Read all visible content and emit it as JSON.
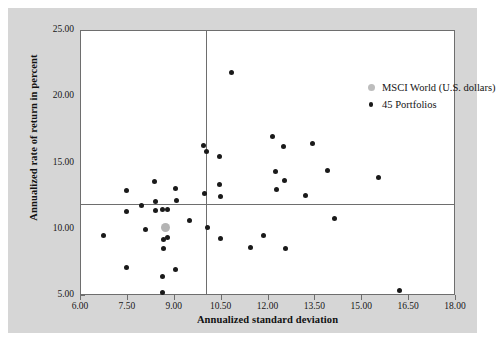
{
  "chart_data": {
    "type": "scatter",
    "title": "",
    "xlabel": "Annualized standard deviation",
    "ylabel": "Annualized rate of return in percent",
    "xlim": [
      6.0,
      18.0
    ],
    "ylim": [
      5.0,
      25.0
    ],
    "xticks": [
      "6.00",
      "7.50",
      "9.00",
      "10.50",
      "12.00",
      "13.50",
      "15.00",
      "16.50",
      "18.00"
    ],
    "yticks": [
      "5.00",
      "10.00",
      "15.00",
      "20.00",
      "25.00"
    ],
    "grid": false,
    "legend_position": "top-right",
    "reference_lines": {
      "vertical_x": 10.0,
      "horizontal_y": 11.95
    },
    "series": [
      {
        "name": "MSCI World (U.S. dollars)",
        "marker": "large-gray-circle",
        "color": "#b4b4b4",
        "points": [
          {
            "x": 8.7,
            "y": 10.2
          }
        ]
      },
      {
        "name": "45 Portfolios",
        "marker": "small-black-circle",
        "color": "#1a1a1a",
        "points": [
          {
            "x": 6.72,
            "y": 9.58
          },
          {
            "x": 7.44,
            "y": 13.0
          },
          {
            "x": 7.46,
            "y": 11.38
          },
          {
            "x": 7.44,
            "y": 7.13
          },
          {
            "x": 7.93,
            "y": 11.82
          },
          {
            "x": 8.06,
            "y": 10.05
          },
          {
            "x": 8.36,
            "y": 13.62
          },
          {
            "x": 8.38,
            "y": 12.15
          },
          {
            "x": 8.39,
            "y": 11.48
          },
          {
            "x": 8.61,
            "y": 11.52
          },
          {
            "x": 8.64,
            "y": 9.28
          },
          {
            "x": 8.63,
            "y": 8.58
          },
          {
            "x": 8.62,
            "y": 6.44
          },
          {
            "x": 8.6,
            "y": 5.25
          },
          {
            "x": 8.78,
            "y": 11.52
          },
          {
            "x": 8.78,
            "y": 9.38
          },
          {
            "x": 9.02,
            "y": 13.12
          },
          {
            "x": 9.04,
            "y": 12.22
          },
          {
            "x": 9.03,
            "y": 7.02
          },
          {
            "x": 9.47,
            "y": 10.68
          },
          {
            "x": 9.92,
            "y": 16.38
          },
          {
            "x": 9.95,
            "y": 12.7
          },
          {
            "x": 10.02,
            "y": 15.9
          },
          {
            "x": 10.04,
            "y": 10.15
          },
          {
            "x": 10.44,
            "y": 15.55
          },
          {
            "x": 10.44,
            "y": 13.42
          },
          {
            "x": 10.47,
            "y": 12.52
          },
          {
            "x": 10.46,
            "y": 9.35
          },
          {
            "x": 10.82,
            "y": 21.85
          },
          {
            "x": 11.42,
            "y": 8.68
          },
          {
            "x": 11.83,
            "y": 9.6
          },
          {
            "x": 12.12,
            "y": 17.05
          },
          {
            "x": 12.22,
            "y": 14.4
          },
          {
            "x": 12.25,
            "y": 13.05
          },
          {
            "x": 12.48,
            "y": 16.28
          },
          {
            "x": 12.52,
            "y": 13.75
          },
          {
            "x": 12.55,
            "y": 8.62
          },
          {
            "x": 13.18,
            "y": 12.62
          },
          {
            "x": 13.42,
            "y": 16.52
          },
          {
            "x": 13.88,
            "y": 14.48
          },
          {
            "x": 14.12,
            "y": 10.88
          },
          {
            "x": 15.52,
            "y": 13.92
          },
          {
            "x": 16.18,
            "y": 5.42
          }
        ]
      }
    ]
  },
  "legend": {
    "items": [
      {
        "label": "MSCI World (U.S. dollars)",
        "swatch": "gray-dot-icon"
      },
      {
        "label": "45 Portfolios",
        "swatch": "black-dot-icon"
      }
    ]
  },
  "colors": {
    "figure_background": "#d6d6d6",
    "plot_background": "#ffffff",
    "axis": "#6e6e6e",
    "marker_portfolios": "#1a1a1a",
    "marker_msci": "#b4b4b4",
    "text": "#131313"
  }
}
